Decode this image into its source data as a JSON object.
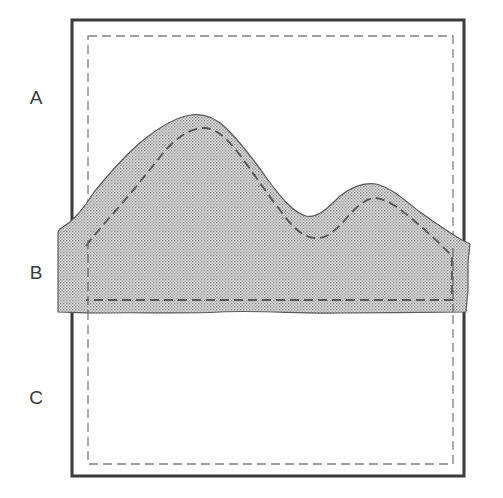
{
  "diagram": {
    "labels": [
      {
        "id": "A",
        "text": "A"
      },
      {
        "id": "B",
        "text": "B"
      },
      {
        "id": "C",
        "text": "C"
      }
    ],
    "colors": {
      "outer_frame": "#3a3a3a",
      "dashed_line": "#707070",
      "shaded_fill": "#d6d6d6",
      "shaded_dot": "#8a8a8a",
      "shape_outline": "#5a5a5a",
      "background": "#ffffff"
    },
    "elements": {
      "outer_frame": "solid rectangle",
      "inner_frame": "dashed rectangle",
      "shaded_region": "stippled mountain-profile strip spanning band B",
      "inner_contour": "dashed profile inside shaded region"
    }
  }
}
